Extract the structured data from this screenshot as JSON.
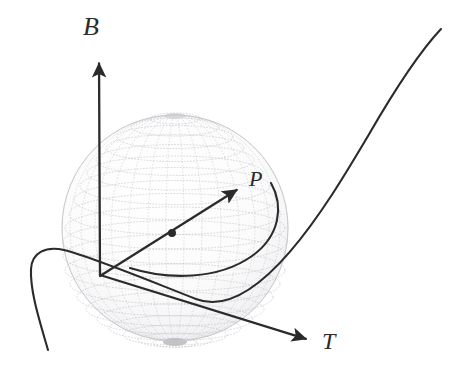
{
  "figure": {
    "kind": "geometry-diagram",
    "background_color": "#ffffff",
    "width": 468,
    "height": 377,
    "ink_color": "#2b2b2b",
    "sphere_mesh_color": "#b9b9bd",
    "sphere": {
      "name": "osculating-sphere",
      "center_x": 175,
      "center_y": 228,
      "radius": 113,
      "outline_color": "#cccccf",
      "shading": "wireframe-dotted-mesh",
      "parallels": 22,
      "meridians": 26
    },
    "origin": {
      "x": 100,
      "y": 275
    },
    "vectors": [
      {
        "id": "B",
        "label": "B",
        "name": "binormal-vector",
        "description": "binormal vector pointing vertically upward",
        "from_x": 100,
        "from_y": 275,
        "to_x": 99,
        "to_y": 56,
        "label_x": 83,
        "label_y": 14,
        "label_size": 26
      },
      {
        "id": "P",
        "label": "P",
        "name": "principal-normal-vector",
        "description": "vector from origin toward the point on the curve, with a marked point on it",
        "from_x": 100,
        "from_y": 276,
        "to_x": 243,
        "to_y": 186,
        "label_x": 249,
        "label_y": 168,
        "label_size": 22,
        "marker_point": {
          "x": 172,
          "y": 233,
          "radius": 4
        }
      },
      {
        "id": "T",
        "label": "T",
        "name": "tangent-vector",
        "description": "tangent vector pointing down and to the right",
        "from_x": 100,
        "from_y": 275,
        "to_x": 313,
        "to_y": 341,
        "label_x": 322,
        "label_y": 329,
        "label_size": 24
      }
    ],
    "curves": [
      {
        "id": "space-curve",
        "name": "space-curve",
        "description": "the main space curve entering from lower left, looping and sweeping up to the upper right",
        "path": "M 48 350 C 40 322 30 292 31 269 C 32 252 46 246 64 250 C 92 257 140 277 196 299 C 258 323 330 200 368 136 C 398 84 424 47 441 29"
      },
      {
        "id": "osculating-circle-arc",
        "name": "osculating-circle-arc",
        "description": "arc of the osculating circle through the marked point, meeting the curve inside the sphere",
        "path": "M 130 268 C 168 280 218 280 252 256 C 280 236 284 206 271 183"
      }
    ],
    "labels": [
      {
        "id": "B",
        "text": "B"
      },
      {
        "id": "P",
        "text": "P"
      },
      {
        "id": "T",
        "text": "T"
      }
    ]
  }
}
